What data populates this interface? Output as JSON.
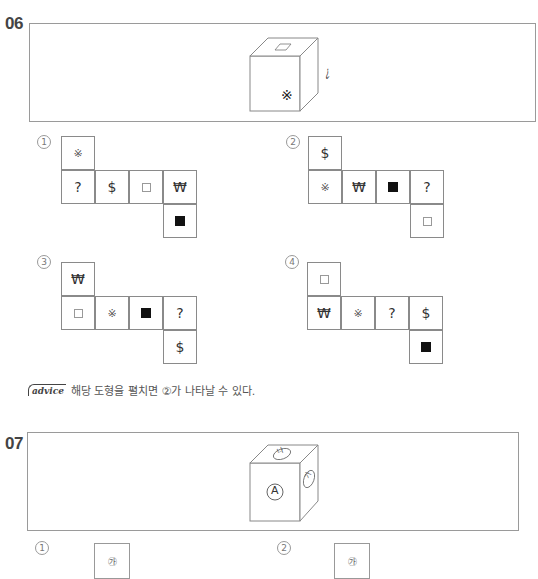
{
  "questions": [
    {
      "number": "06",
      "cube": {
        "front": "※",
        "top": "□",
        "right": "¿"
      },
      "options": [
        {
          "label": "1",
          "label_glyph": "①",
          "cells": [
            {
              "row": 0,
              "col": 0,
              "symbol": "※"
            },
            {
              "row": 1,
              "col": 0,
              "symbol": "?"
            },
            {
              "row": 1,
              "col": 1,
              "symbol": "$"
            },
            {
              "row": 1,
              "col": 2,
              "symbol": "□"
            },
            {
              "row": 1,
              "col": 3,
              "symbol": "₩"
            },
            {
              "row": 2,
              "col": 3,
              "symbol": "■"
            }
          ]
        },
        {
          "label": "2",
          "label_glyph": "②",
          "cells": [
            {
              "row": 0,
              "col": 0,
              "symbol": "$"
            },
            {
              "row": 1,
              "col": 0,
              "symbol": "※"
            },
            {
              "row": 1,
              "col": 1,
              "symbol": "₩"
            },
            {
              "row": 1,
              "col": 2,
              "symbol": "■"
            },
            {
              "row": 1,
              "col": 3,
              "symbol": "?"
            },
            {
              "row": 2,
              "col": 3,
              "symbol": "□"
            }
          ]
        },
        {
          "label": "3",
          "label_glyph": "③",
          "cells": [
            {
              "row": 0,
              "col": 0,
              "symbol": "₩"
            },
            {
              "row": 1,
              "col": 0,
              "symbol": "□"
            },
            {
              "row": 1,
              "col": 1,
              "symbol": "※"
            },
            {
              "row": 1,
              "col": 2,
              "symbol": "■"
            },
            {
              "row": 1,
              "col": 3,
              "symbol": "?"
            },
            {
              "row": 2,
              "col": 3,
              "symbol": "$"
            }
          ]
        },
        {
          "label": "4",
          "label_glyph": "④",
          "cells": [
            {
              "row": 0,
              "col": 0,
              "symbol": "□"
            },
            {
              "row": 1,
              "col": 0,
              "symbol": "₩"
            },
            {
              "row": 1,
              "col": 1,
              "symbol": "※"
            },
            {
              "row": 1,
              "col": 2,
              "symbol": "?"
            },
            {
              "row": 1,
              "col": 3,
              "symbol": "$"
            },
            {
              "row": 2,
              "col": 3,
              "symbol": "■"
            }
          ]
        }
      ],
      "advice": {
        "badge": "advice",
        "text": "해당 도형을 펼치면 ②가 나타날 수 있다."
      }
    },
    {
      "number": "07",
      "cube": {
        "front": "Ⓐ",
        "top": "㉯",
        "right": "㉮"
      },
      "options": [
        {
          "label": "1",
          "label_glyph": "①",
          "top_cell": "㉮"
        },
        {
          "label": "2",
          "label_glyph": "②",
          "top_cell": "㉮"
        }
      ]
    }
  ]
}
